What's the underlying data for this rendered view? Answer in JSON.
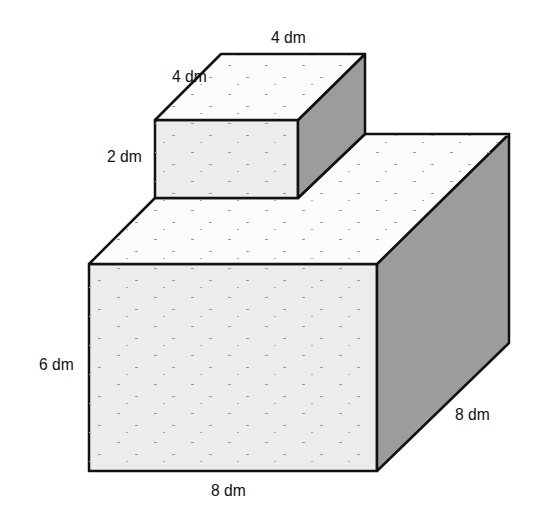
{
  "diagram": {
    "type": "composite-rectangular-prism",
    "colors": {
      "front_face": "#ececec",
      "top_face": "#fcfcfc",
      "side_face": "#9c9c9c",
      "edge": "#111111",
      "background": "#ffffff"
    },
    "small_box": {
      "width_label": "4 dm",
      "depth_label": "4 dm",
      "height_label": "2 dm"
    },
    "large_box": {
      "width_label": "8 dm",
      "depth_label": "8 dm",
      "height_label": "6 dm"
    }
  }
}
